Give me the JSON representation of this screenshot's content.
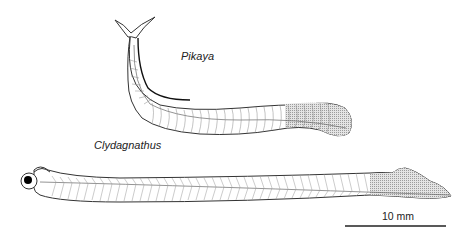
{
  "figure": {
    "specimens": [
      {
        "name": "Pikaya",
        "label_pos": {
          "x": 181,
          "y": 57
        }
      },
      {
        "name": "Clydagnathus",
        "label_pos": {
          "x": 94,
          "y": 145
        }
      }
    ],
    "scale_bar": {
      "label": "10 mm",
      "length_px": 101
    },
    "colors": {
      "outline": "#333333",
      "hatch": "#9a9a9a",
      "shade": "#c8c8c8",
      "background": "#ffffff"
    }
  }
}
